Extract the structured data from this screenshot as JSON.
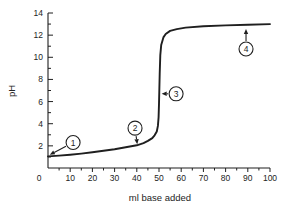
{
  "figure": {
    "background": "#ffffff",
    "ink_color": "#1f1f1f"
  },
  "chart_data": {
    "type": "line",
    "title": "",
    "xlabel": "ml base added",
    "ylabel": "pH",
    "xlim": [
      0,
      100
    ],
    "ylim": [
      0,
      14
    ],
    "x_major_ticks": [
      0,
      10,
      20,
      30,
      40,
      50,
      60,
      70,
      80,
      90,
      100
    ],
    "x_minor_tick_step": 5,
    "y_major_ticks": [
      0,
      2,
      4,
      6,
      8,
      10,
      12,
      14
    ],
    "y_major_tick_labels": [
      2,
      4,
      6,
      8,
      10,
      12,
      14
    ],
    "y_minor_tick_step": 1,
    "grid": false,
    "legend": null,
    "series": [
      {
        "name": "acid-base-titration-curve",
        "points": [
          [
            0,
            1.05
          ],
          [
            5,
            1.12
          ],
          [
            10,
            1.2
          ],
          [
            15,
            1.3
          ],
          [
            20,
            1.42
          ],
          [
            25,
            1.55
          ],
          [
            30,
            1.7
          ],
          [
            35,
            1.88
          ],
          [
            40,
            2.05
          ],
          [
            43,
            2.25
          ],
          [
            45,
            2.45
          ],
          [
            47,
            2.7
          ],
          [
            48,
            2.95
          ],
          [
            49,
            3.3
          ],
          [
            49.5,
            3.8
          ],
          [
            49.8,
            4.6
          ],
          [
            50,
            5.8
          ],
          [
            50.3,
            8.5
          ],
          [
            50.6,
            10.2
          ],
          [
            51,
            11.1
          ],
          [
            52,
            11.8
          ],
          [
            53,
            12.1
          ],
          [
            55,
            12.38
          ],
          [
            58,
            12.55
          ],
          [
            62,
            12.68
          ],
          [
            70,
            12.8
          ],
          [
            80,
            12.88
          ],
          [
            90,
            12.94
          ],
          [
            100,
            13.0
          ]
        ]
      }
    ],
    "annotations": [
      {
        "label": "1",
        "circle_at": [
          11.3,
          2.3
        ],
        "arrow_tip": [
          0.8,
          1.2
        ]
      },
      {
        "label": "2",
        "circle_at": [
          39.2,
          3.6
        ],
        "arrow_tip": [
          40.2,
          2.15
        ]
      },
      {
        "label": "3",
        "circle_at": [
          57.7,
          6.7
        ],
        "arrow_tip": [
          51.2,
          6.7
        ]
      },
      {
        "label": "4",
        "circle_at": [
          89.2,
          10.75
        ],
        "arrow_tip": [
          89.2,
          12.55
        ]
      }
    ]
  }
}
